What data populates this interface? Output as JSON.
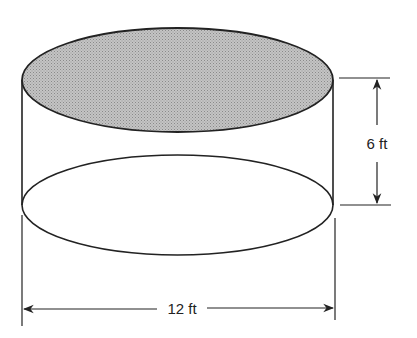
{
  "diagram": {
    "shape": "cylinder",
    "top_face": "shaded",
    "colors": {
      "stroke": "#222222",
      "top_fill": "#b8b8b8",
      "background": "#ffffff"
    },
    "dimensions": {
      "height_label": "6 ft",
      "diameter_label": "12 ft"
    }
  }
}
